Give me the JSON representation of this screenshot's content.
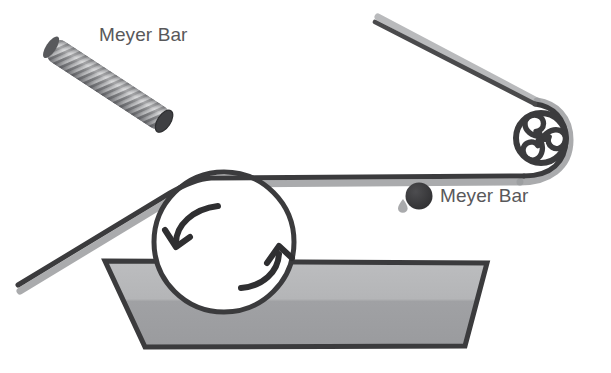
{
  "figure": {
    "kind": "process-schematic",
    "background_color": "#ffffff"
  },
  "labels": {
    "rod_label": "Meyer Bar",
    "bar_section_label": "Meyer Bar"
  },
  "colors": {
    "label_text": "#58585a",
    "web_dark": "#3b3b3d",
    "web_shadow": "#8f9093",
    "roller_stroke": "#3b3b3d",
    "roller_fill": "#ffffff",
    "substrate_fill_light": "#b8b9bb",
    "substrate_fill_dark": "#9a9b9e",
    "substrate_stroke": "#3b3b3d",
    "rod_wire_light": "#cfd0d2",
    "rod_wire_dark": "#77787b",
    "rod_cap": "#4a4a4c",
    "arrow_stroke": "#2f2f31",
    "bar_dot": "#39393b",
    "droplet": "#a9aaac"
  },
  "components": {
    "wound_rod": {
      "name": "wire-wound-meyer-bar",
      "x1": 40,
      "y1": 40,
      "x2": 176,
      "y2": 129,
      "thickness": 25,
      "winding_count": 44
    },
    "applicator_roller": {
      "name": "applicator-roller",
      "cx": 224,
      "cy": 242,
      "r": 70,
      "stroke_width": 5,
      "rotation": "clockwise"
    },
    "rotation_arrows": [
      {
        "name": "rotation-arrow-left",
        "direction": "counterclockwise-head-down-left"
      },
      {
        "name": "rotation-arrow-right",
        "direction": "clockwise-head-up-right"
      }
    ],
    "grooved_roller": {
      "name": "grooved-pinwheel-roller",
      "cx": 541,
      "cy": 138,
      "r": 25,
      "stroke_width": 6,
      "pattern": "triskelion-pinwheel",
      "lobes": 3
    },
    "meyer_bar_cross_section": {
      "name": "meyer-bar-cross-section-dot",
      "cx": 419,
      "cy": 196,
      "r": 13
    },
    "coating_droplet": {
      "name": "coating-droplet",
      "cx": 403,
      "cy": 205,
      "r": 4
    },
    "substrate_sheet": {
      "name": "substrate-sheet",
      "points": "105,261 487,263 465,346 145,347",
      "stroke_width": 5
    },
    "web_path": {
      "name": "web-film-path",
      "segments": [
        {
          "id": "infeed-diagonal",
          "from": [
            18,
            285
          ],
          "to": [
            170,
            193
          ]
        },
        {
          "id": "over-applicator-roller",
          "from": [
            170,
            193
          ],
          "to": [
            210,
            178
          ]
        },
        {
          "id": "horizontal-run",
          "from": [
            210,
            178
          ],
          "to": [
            528,
            176
          ]
        },
        {
          "id": "wrap-grooved-roller",
          "from": [
            528,
            176
          ],
          "to": [
            540,
            110
          ]
        },
        {
          "id": "outfeed-diagonal",
          "from": [
            540,
            110
          ],
          "to": [
            374,
            22
          ]
        }
      ],
      "dark_width": 5,
      "shadow_width": 6
    }
  }
}
